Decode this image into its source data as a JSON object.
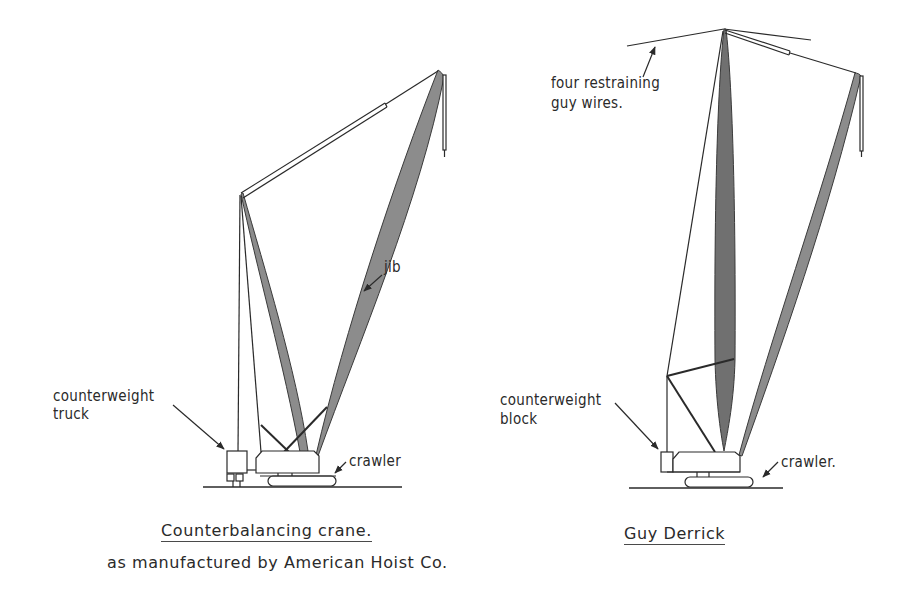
{
  "figure": {
    "left_crane": {
      "title": "Counterbalancing crane.",
      "subtitle": "as manufactured by American Hoist Co.",
      "labels": {
        "jib": "jib",
        "counterweight_line1": "counterweight",
        "counterweight_line2": "truck",
        "crawler": "crawler"
      }
    },
    "right_crane": {
      "title": "Guy Derrick",
      "labels": {
        "guy_wires_line1": "four restraining",
        "guy_wires_line2": "guy wires.",
        "counterweight_line1": "counterweight",
        "counterweight_line2": "block",
        "crawler": "crawler."
      }
    },
    "colors": {
      "ink": "#2a2a2a",
      "boom_fill": "#8a8a8a",
      "mast_fill_dark": "#6e6e6e",
      "background": "#ffffff"
    }
  }
}
